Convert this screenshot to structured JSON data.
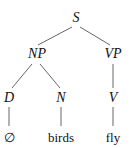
{
  "tree": {
    "root": "S",
    "np": "NP",
    "vp": "VP",
    "d": "D",
    "n": "N",
    "v": "V",
    "leaf_d": "∅",
    "leaf_n": "birds",
    "leaf_v": "fly"
  }
}
